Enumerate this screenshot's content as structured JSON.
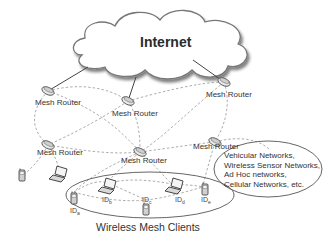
{
  "cloud": {
    "label": "Internet"
  },
  "routers": [
    {
      "label": "Mesh Router"
    },
    {
      "label": "Mesh Router"
    },
    {
      "label": "Mesh Router"
    },
    {
      "label": "Mesh Router"
    },
    {
      "label": "Mesh Router"
    },
    {
      "label": "Mesh Router"
    }
  ],
  "external_networks": {
    "lines": [
      "Vehicular Networks,",
      "Wireless Sensor Networks,",
      "Ad Hoc networks,",
      "Cellular Networks, etc."
    ]
  },
  "clients": {
    "title": "Wireless Mesh Clients",
    "ids": [
      {
        "label": "ID",
        "sub": "a"
      },
      {
        "label": "ID",
        "sub": "b"
      },
      {
        "label": "ID",
        "sub": "c"
      },
      {
        "label": "ID",
        "sub": "d"
      },
      {
        "label": "ID",
        "sub": "e"
      }
    ]
  },
  "colors": {
    "line": "#555555",
    "dashed": "#888888",
    "cloud_stroke": "#777777",
    "device": "#999999"
  }
}
